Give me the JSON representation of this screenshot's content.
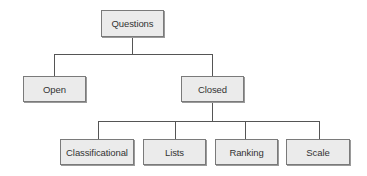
{
  "diagram": {
    "type": "tree",
    "root": {
      "label": "Questions",
      "children": [
        {
          "label": "Open",
          "children": []
        },
        {
          "label": "Closed",
          "children": [
            {
              "label": "Classificational"
            },
            {
              "label": "Lists"
            },
            {
              "label": "Ranking"
            },
            {
              "label": "Scale"
            }
          ]
        }
      ]
    },
    "colors": {
      "node_fill": "#ebebeb",
      "node_border": "#7a7a7a",
      "line": "#555555"
    }
  },
  "nodes": {
    "questions": "Questions",
    "open": "Open",
    "closed": "Closed",
    "classificational": "Classificational",
    "lists": "Lists",
    "ranking": "Ranking",
    "scale": "Scale"
  }
}
